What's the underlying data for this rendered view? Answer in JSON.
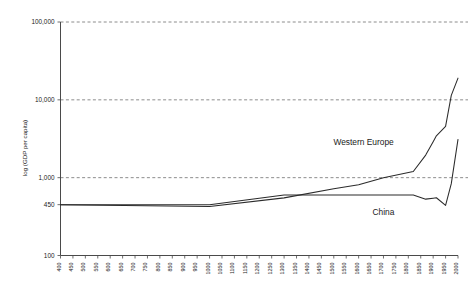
{
  "chart_data": {
    "type": "line",
    "title": "",
    "xlabel": "",
    "ylabel": "log (GDP per capita)",
    "yscale": "log",
    "ylim": [
      100,
      100000
    ],
    "xlim": [
      400,
      2000
    ],
    "grid": true,
    "gridlines_at": [
      1000,
      10000,
      100000
    ],
    "legend_position": "inline-annotation",
    "ytick_labels": [
      "100,000",
      "10,000",
      "1,000",
      "450",
      "100"
    ],
    "ytick_values": [
      100000,
      10000,
      1000,
      450,
      100
    ],
    "xtick_labels": [
      "400",
      "450",
      "500",
      "550",
      "600",
      "650",
      "700",
      "750",
      "800",
      "850",
      "900",
      "950",
      "1000",
      "1050",
      "1100",
      "1150",
      "1200",
      "1250",
      "1300",
      "1350",
      "1400",
      "1450",
      "1500",
      "1550",
      "1600",
      "1650",
      "1700",
      "1750",
      "1800",
      "1850",
      "1900",
      "1950",
      "2000"
    ],
    "xtick_values": [
      400,
      450,
      500,
      550,
      600,
      650,
      700,
      750,
      800,
      850,
      900,
      950,
      1000,
      1050,
      1100,
      1150,
      1200,
      1250,
      1300,
      1350,
      1400,
      1450,
      1500,
      1550,
      1600,
      1650,
      1700,
      1750,
      1800,
      1850,
      1900,
      1950,
      2000
    ],
    "series": [
      {
        "name": "Western Europe",
        "color": "#2b2b2b",
        "label_x": 1620,
        "label_y": 2600,
        "x": [
          400,
          1000,
          1300,
          1500,
          1600,
          1700,
          1820,
          1870,
          1900,
          1913,
          1950,
          1973,
          2000
        ],
        "values": [
          450,
          425,
          550,
          720,
          810,
          1000,
          1200,
          1950,
          2900,
          3450,
          4550,
          11400,
          19000
        ]
      },
      {
        "name": "China",
        "color": "#2b2b2b",
        "label_x": 1700,
        "label_y": 330,
        "x": [
          400,
          1000,
          1300,
          1500,
          1600,
          1700,
          1820,
          1870,
          1900,
          1913,
          1950,
          1973,
          2000
        ],
        "values": [
          450,
          450,
          600,
          600,
          600,
          600,
          600,
          530,
          545,
          552,
          440,
          838,
          3100
        ]
      }
    ]
  }
}
